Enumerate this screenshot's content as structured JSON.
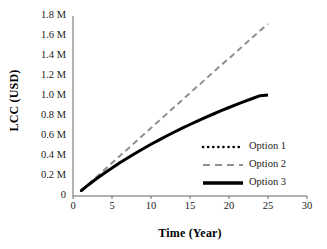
{
  "chart_data": {
    "type": "line",
    "title": "",
    "xlabel": "Time (Year)",
    "ylabel": "LCC (USD)",
    "xlim": [
      0,
      30
    ],
    "ylim": [
      0,
      1800000
    ],
    "xticks": [
      0,
      5,
      10,
      15,
      20,
      25,
      30
    ],
    "yticks": [
      0,
      200000,
      400000,
      600000,
      800000,
      1000000,
      1200000,
      1400000,
      1600000,
      1800000
    ],
    "xtick_labels": [
      "0",
      "5",
      "10",
      "15",
      "20",
      "25",
      "30"
    ],
    "ytick_labels": [
      "0",
      "0.2 M",
      "0.4 M",
      "0.6 M",
      "0.8 M",
      "1.0 M",
      "1.2 M",
      "1.4 M",
      "1.6 M",
      "1.8 M"
    ],
    "grid": false,
    "legend_position": "center-right",
    "x": [
      1,
      2,
      3,
      4,
      5,
      6,
      7,
      8,
      9,
      10,
      11,
      12,
      13,
      14,
      15,
      16,
      17,
      18,
      19,
      20,
      21,
      22,
      23,
      24,
      25
    ],
    "series": [
      {
        "name": "Option 1",
        "style": "dotted",
        "color": "#000000",
        "width": 2,
        "note": "overlaps Option 3",
        "values": [
          50000,
          113000,
          172000,
          228000,
          281000,
          332000,
          381000,
          428000,
          473000,
          517000,
          559000,
          600000,
          640000,
          678000,
          715000,
          751000,
          786000,
          820000,
          853000,
          885000,
          916000,
          946000,
          975000,
          1003000,
          1010000
        ]
      },
      {
        "name": "Option 2",
        "style": "dashed",
        "color": "#909090",
        "width": 2,
        "values": [
          50000,
          120000,
          190000,
          260000,
          330000,
          400000,
          470000,
          540000,
          610000,
          680000,
          750000,
          820000,
          890000,
          960000,
          1030000,
          1100000,
          1170000,
          1240000,
          1310000,
          1375000,
          1445000,
          1515000,
          1585000,
          1655000,
          1720000
        ]
      },
      {
        "name": "Option 3",
        "style": "solid",
        "color": "#000000",
        "width": 3,
        "values": [
          50000,
          113000,
          172000,
          228000,
          281000,
          332000,
          381000,
          428000,
          473000,
          517000,
          559000,
          600000,
          640000,
          678000,
          715000,
          751000,
          786000,
          820000,
          853000,
          885000,
          916000,
          946000,
          975000,
          1003000,
          1010000
        ]
      }
    ]
  },
  "legend": {
    "items": [
      {
        "label": "Option 1"
      },
      {
        "label": "Option 2"
      },
      {
        "label": "Option 3"
      }
    ]
  },
  "colors": {
    "axis": "#555555",
    "option1": "#000000",
    "option2": "#909090",
    "option3": "#000000",
    "background": "#ffffff"
  }
}
